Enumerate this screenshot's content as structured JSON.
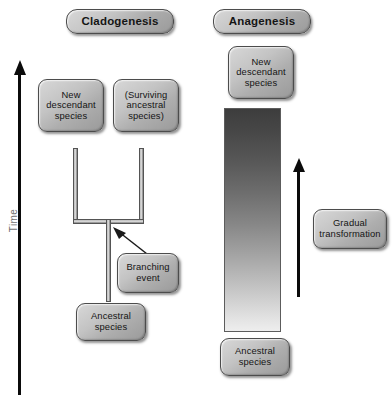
{
  "diagram": {
    "caption_absent": true,
    "axis": {
      "time_label": "Time",
      "time_direction": "upward",
      "arrow_color": "#0b0b0b"
    },
    "panels": [
      {
        "id": "cladogenesis",
        "title": "Cladogenesis",
        "boxes": [
          {
            "name": "new-descendant-species",
            "text": "New\ndescendant\nspecies"
          },
          {
            "name": "surviving-ancestral-species",
            "text": "(Surviving\nancestral\nspecies)"
          },
          {
            "name": "branching-event",
            "text": "Branching\nevent"
          },
          {
            "name": "ancestral-species",
            "text": "Ancestral\nspecies"
          }
        ]
      },
      {
        "id": "anagenesis",
        "title": "Anagenesis",
        "boxes": [
          {
            "name": "new-descendant-species",
            "text": "New\ndescendant\nspecies"
          },
          {
            "name": "gradual-transformation",
            "text": "Gradual\ntransformation"
          },
          {
            "name": "ancestral-species",
            "text": "Ancestral\nspecies"
          }
        ]
      }
    ],
    "colors": {
      "box_fill_light": "#d8d8d8",
      "box_fill_dark": "#9a9a9a",
      "box_border": "#4c4c4c",
      "arrow": "#0b0b0b",
      "time_label": "#6f6f6f",
      "gradient_top": "#3d3d3d",
      "gradient_bottom": "#eeeeee",
      "background": "#ffffff"
    }
  }
}
